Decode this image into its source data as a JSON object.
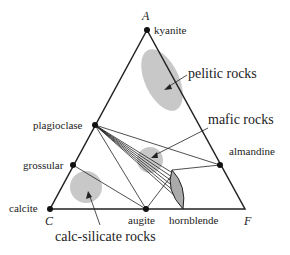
{
  "diagram": {
    "type": "ternary ACF diagram",
    "vertices": {
      "top": "A",
      "bottom_left": "C",
      "bottom_right": "F"
    },
    "minerals": [
      {
        "name": "kyanite"
      },
      {
        "name": "plagioclase"
      },
      {
        "name": "grossular"
      },
      {
        "name": "calcite"
      },
      {
        "name": "augite"
      },
      {
        "name": "hornblende"
      },
      {
        "name": "almandine"
      }
    ],
    "rock_fields": [
      {
        "name": "pelitic rocks"
      },
      {
        "name": "mafic rocks"
      },
      {
        "name": "calc-silicate rocks"
      }
    ],
    "colors": {
      "line": "#222222",
      "field": "#c8c8c8",
      "hornblende": "#aaaaaa"
    }
  }
}
